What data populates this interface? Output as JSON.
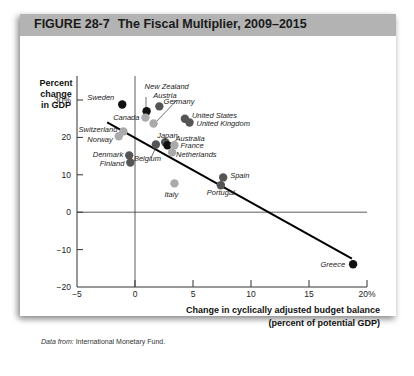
{
  "figure": {
    "number": "FIGURE  28-7",
    "title": "The Fiscal Multiplier, 2009–2015",
    "source_label": "Data from:",
    "source_text": " International Monetary Fund."
  },
  "axes": {
    "ylabel_lines": [
      "Percent",
      "change",
      "in GDP"
    ],
    "xlabel_lines": [
      "Change in cyclically adjusted budget balance",
      "(percent of potential GDP)"
    ],
    "yticks": [
      "30%",
      "20",
      "10",
      "0",
      "−10",
      "−20"
    ],
    "xticks": [
      "−5",
      "0",
      "5",
      "10",
      "15",
      "20%"
    ]
  },
  "colors": {
    "black": "#111111",
    "dark": "#555555",
    "light": "#aaaaaa",
    "banner": "#b3b3b3"
  },
  "chart_data": {
    "type": "scatter",
    "title": "The Fiscal Multiplier, 2009–2015",
    "xlabel": "Change in cyclically adjusted budget balance (percent of potential GDP)",
    "ylabel": "Percent change in GDP",
    "xlim": [
      -5,
      20
    ],
    "ylim": [
      -20,
      30
    ],
    "xticks": [
      -5,
      0,
      5,
      10,
      15,
      20
    ],
    "yticks": [
      -20,
      -10,
      0,
      10,
      20,
      30
    ],
    "grid": false,
    "legend": null,
    "points": [
      {
        "label": "Sweden",
        "x": -1.1,
        "y": 28.8,
        "shade": "black"
      },
      {
        "label": "New Zealand",
        "x": 1.0,
        "y": 27.0,
        "shade": "black"
      },
      {
        "label": "Canada",
        "x": 0.9,
        "y": 25.3,
        "shade": "light"
      },
      {
        "label": "Austria",
        "x": 2.1,
        "y": 28.3,
        "shade": "dark"
      },
      {
        "label": "Germany",
        "x": 1.6,
        "y": 23.7,
        "shade": "light"
      },
      {
        "label": "United States",
        "x": 4.3,
        "y": 25.0,
        "shade": "dark"
      },
      {
        "label": "United Kingdom",
        "x": 4.7,
        "y": 24.0,
        "shade": "dark"
      },
      {
        "label": "Switzerland",
        "x": -1.0,
        "y": 21.6,
        "shade": "light"
      },
      {
        "label": "Norway",
        "x": -1.4,
        "y": 20.3,
        "shade": "light"
      },
      {
        "label": "Japan",
        "x": 2.6,
        "y": 18.7,
        "shade": "dark"
      },
      {
        "label": "Australia",
        "x": 2.8,
        "y": 17.9,
        "shade": "black"
      },
      {
        "label": "France",
        "x": 3.4,
        "y": 17.9,
        "shade": "light"
      },
      {
        "label": "Netherlands",
        "x": 3.2,
        "y": 16.0,
        "shade": "light"
      },
      {
        "label": "Belgium",
        "x": 1.8,
        "y": 18.1,
        "shade": "dark"
      },
      {
        "label": "Denmark",
        "x": -0.5,
        "y": 15.2,
        "shade": "dark"
      },
      {
        "label": "Finland",
        "x": -0.4,
        "y": 13.3,
        "shade": "dark"
      },
      {
        "label": "Italy",
        "x": 3.4,
        "y": 7.7,
        "shade": "light"
      },
      {
        "label": "Spain",
        "x": 7.6,
        "y": 9.3,
        "shade": "dark"
      },
      {
        "label": "Portugal",
        "x": 7.4,
        "y": 7.2,
        "shade": "dark"
      },
      {
        "label": "Greece",
        "x": 18.8,
        "y": -13.9,
        "shade": "black"
      }
    ],
    "trendline": {
      "x1": -2.4,
      "y1": 24.0,
      "x2": 18.7,
      "y2": -12.4
    }
  }
}
